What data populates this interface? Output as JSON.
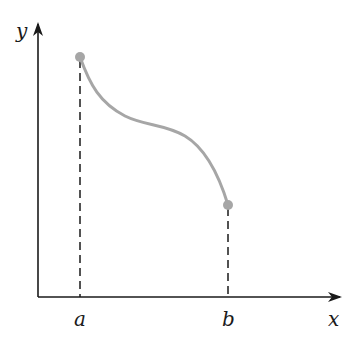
{
  "figure": {
    "type": "function-graph",
    "axes": {
      "x_label": "x",
      "y_label": "y"
    },
    "interval": {
      "start_label": "a",
      "end_label": "b"
    },
    "curve": {
      "description": "decreasing curve from (a, f(a)) to (b, f(b)) with an inflection",
      "color": "#a6a6a6"
    },
    "endpoints": [
      {
        "label": "a",
        "marker": "filled-circle"
      },
      {
        "label": "b",
        "marker": "filled-circle"
      }
    ],
    "colors": {
      "axes": "#1a1a1a",
      "curve": "#a6a6a6",
      "dashes": "#1a1a1a"
    }
  }
}
